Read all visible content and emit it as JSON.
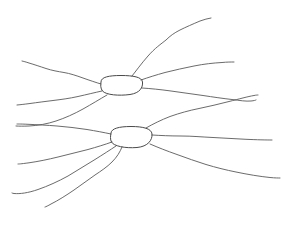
{
  "canvas": {
    "width": 295,
    "height": 227,
    "background": "#ffffff",
    "title": "Hand-drawn two-node radiating branch sketch"
  },
  "style": {
    "stroke_color": "#5a5a5a",
    "node_stroke_color": "#4a4a4a",
    "stroke_width": 0.9,
    "node_stroke_width": 1.0
  },
  "nodes": [
    {
      "id": "upper-node",
      "label": "",
      "shape": "ellipse",
      "cx": 121,
      "cy": 86,
      "rx": 22,
      "ry": 9,
      "path": "M 101 82 C 101 77 109 75.5 121 75.5 C 133 75.5 142 77 142.5 82 C 143 87.5 140 93 130 94.5 C 119 96 106 95 102.5 91 C 100.5 88.5 100.5 85 101 82 Z"
    },
    {
      "id": "lower-node",
      "label": "",
      "shape": "ellipse",
      "cx": 131,
      "cy": 137,
      "rx": 21,
      "ry": 10,
      "path": "M 111 133 C 111.5 128.5 119 126.5 131 126.5 C 143 126.5 151.5 128.5 152 134 C 152.5 140 148 146.5 137 147.5 C 125 148.5 113.5 146 111.5 142 C 110 139.5 110.5 135.5 111 133 Z"
    }
  ],
  "branches": [
    {
      "id": "upper-br-1",
      "from_node": "upper-node",
      "direction": "up-right-steep",
      "endpoint": [
        211,
        18
      ],
      "path": "M 132 76 C 136 71 141 64 148 56 C 155 48 161 44 166 40 C 170 36 174 33 180 30 C 186 27 193 24 200 21 C 204 19.5 208 18.5 211 18"
    },
    {
      "id": "upper-br-2",
      "from_node": "upper-node",
      "direction": "right-upper",
      "endpoint": [
        234,
        62
      ],
      "path": "M 141 80 C 148 77.5 156 75 165 72.5 C 175 70 184 68 194 66 C 204 64 213 63 222 62.5 C 227 62 231 62 234 62"
    },
    {
      "id": "upper-br-3",
      "from_node": "upper-node",
      "direction": "right-lower",
      "endpoint": [
        256,
        100
      ],
      "path": "M 142 88 C 150 88.5 160 89.5 171 91 C 182 92.5 192 94 203 95.5 C 213 97 223 98.5 232 99.5 C 240 100.5 246 101.5 251 101 C 254 100.7 255.5 100.3 256 100"
    },
    {
      "id": "upper-br-4",
      "from_node": "upper-node",
      "direction": "left-upper",
      "endpoint": [
        22,
        61
      ],
      "path": "M 101 84 C 96 82.5 90 80.5 83 78 C 76 75.5 70 73.5 64 72.5 C 58 71.5 52 70.5 46 68.5 C 40 66.5 34 64.5 29 63 C 26 62 23.5 61.3 22 61"
    },
    {
      "id": "upper-br-5",
      "from_node": "upper-node",
      "direction": "left-lower",
      "endpoint": [
        17,
        105
      ],
      "path": "M 102 91 C 95 92.5 87 94.5 78 96.5 C 69 98.5 61 99.5 53 100.5 C 45 101.5 37 102.5 30 103.5 C 24 104.3 19.5 104.8 17 105"
    },
    {
      "id": "upper-br-6",
      "from_node": "upper-node",
      "direction": "down-left-to-mid",
      "endpoint": [
        16,
        126
      ],
      "path": "M 107 95 C 100 99 92 104 83 109 C 74 114 65 118 56 121 C 47 124 38 125.5 29 126 C 23 126.3 19 126.2 16 126"
    },
    {
      "id": "lower-br-1",
      "from_node": "lower-node",
      "direction": "up-right-to-mid",
      "endpoint": [
        258,
        95
      ],
      "path": "M 146 128 C 153 124 161 120 170 116.5 C 180 113 189 110.5 199 108.5 C 209 106.5 219 104 229 101.5 C 239 99 248 96.5 254 95.5 C 256.5 95 257.5 95 258 95"
    },
    {
      "id": "lower-br-2",
      "from_node": "lower-node",
      "direction": "right-horizontal",
      "endpoint": [
        272,
        140
      ],
      "path": "M 152 135 C 160 135.5 170 136 181 136 C 192 136 202 137 213 137.5 C 224 138 235 138.8 246 139.3 C 257 139.8 266 140 272 140"
    },
    {
      "id": "lower-br-3",
      "from_node": "lower-node",
      "direction": "right-down",
      "endpoint": [
        280,
        178
      ],
      "path": "M 150 144 C 158 147.5 167 151 177 154.5 C 187 158 196 161.5 206 164.5 C 216 167.5 226 170 236 172 C 248 174.5 260 176.5 270 177.5 C 275 178 278.5 178 280 178"
    },
    {
      "id": "lower-br-4",
      "from_node": "lower-node",
      "direction": "left-horizontal",
      "endpoint": [
        17,
        124
      ],
      "path": "M 111 134 C 104 132.5 96 131 87 129.5 C 77 128 67 126.8 57 126 C 47 125.2 37 124.7 28 124.3 C 22 124 18.5 124 17 124"
    },
    {
      "id": "lower-br-5",
      "from_node": "lower-node",
      "direction": "left-down-shallow",
      "endpoint": [
        18,
        164
      ],
      "path": "M 112 142 C 105 144.5 97 147 88 149.5 C 78 152 68 154.5 58 157 C 48 159.5 38 161.5 29 162.8 C 23 163.6 20 164 18 164"
    },
    {
      "id": "lower-br-6",
      "from_node": "lower-node",
      "direction": "down-left-steep",
      "endpoint": [
        45,
        207
      ],
      "path": "M 122 147 C 120 152 117 157 112 162 C 107 167 101 171 95 175 C 88 180 81 185 74 190 C 66 195.5 58 200.5 51 204 C 48 205.8 46 206.7 45 207"
    },
    {
      "id": "lower-br-7",
      "from_node": "lower-node",
      "direction": "down-left-shallow",
      "endpoint": [
        12,
        193
      ],
      "path": "M 116 146 C 110 150 103 154.5 95 159.5 C 86 165 77 170.5 68 176 C 58 181.5 48 186 38 189.5 C 28 193 20 194 14 193.5 C 13 193.4 12.4 193.2 12 193"
    }
  ],
  "summary": {
    "node_count": 2,
    "branch_count": 13
  }
}
